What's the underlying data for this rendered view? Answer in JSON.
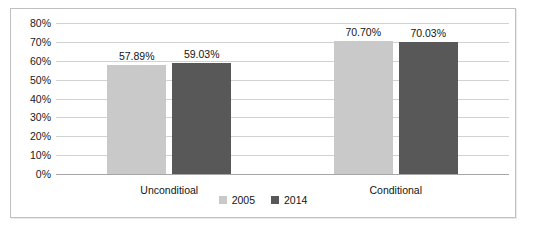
{
  "chart_data": {
    "type": "bar",
    "title": "",
    "xlabel": "",
    "ylabel": "",
    "categories": [
      "Unconditioal",
      "Conditional"
    ],
    "series": [
      {
        "name": "2005",
        "color": "#c9c9c9",
        "values": [
          57.89,
          70.7
        ],
        "labels": [
          "57.89%",
          "70.70%"
        ]
      },
      {
        "name": "2014",
        "color": "#585858",
        "values": [
          59.03,
          70.03
        ],
        "labels": [
          "59.03%",
          "70.03%"
        ]
      }
    ],
    "ylim": [
      0,
      80
    ],
    "ytick_step": 10,
    "ytick_labels": [
      "80%",
      "70%",
      "60%",
      "50%",
      "40%",
      "30%",
      "20%",
      "10%",
      "0%"
    ],
    "ytick_values": [
      80,
      70,
      60,
      50,
      40,
      30,
      20,
      10,
      0
    ],
    "grid": true,
    "legend_position": "bottom",
    "value_labels_shown": true,
    "border_color": "#c0c0c0",
    "gridline_color": "#d2d2d2",
    "axis_color": "#a6a6a6",
    "text_color": "#141414",
    "background": "#ffffff"
  }
}
